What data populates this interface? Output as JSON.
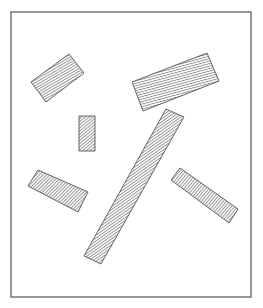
{
  "figure": {
    "width": 263,
    "height": 308,
    "background": "#ffffff",
    "frame": {
      "x": 11,
      "y": 12,
      "width": 240,
      "height": 285,
      "stroke": "#6b6b6b",
      "stroke_width": 1.4
    },
    "hatch": {
      "stroke": "#707070",
      "fill": "#ffffff",
      "outline": "#555555",
      "spacing": 2.4,
      "line_width": 0.8
    },
    "shapes": [
      {
        "name": "upper-left-bar",
        "points": [
          [
            31,
            82
          ],
          [
            69,
            54
          ],
          [
            84,
            73
          ],
          [
            46,
            102
          ]
        ],
        "hatch_angle": 60
      },
      {
        "name": "upper-right-bar",
        "points": [
          [
            132,
            82
          ],
          [
            207,
            53
          ],
          [
            219,
            81
          ],
          [
            143,
            111
          ]
        ],
        "hatch_angle": 75
      },
      {
        "name": "small-vertical-bar",
        "points": [
          [
            79,
            116
          ],
          [
            95,
            116
          ],
          [
            95,
            151
          ],
          [
            79,
            151
          ]
        ],
        "hatch_angle": 50
      },
      {
        "name": "long-diagonal-bar",
        "points": [
          [
            166,
            109
          ],
          [
            184,
            117
          ],
          [
            101,
            264
          ],
          [
            84,
            256
          ]
        ],
        "hatch_angle": 55
      },
      {
        "name": "lower-left-bar",
        "points": [
          [
            28,
            186
          ],
          [
            38,
            170
          ],
          [
            88,
            192
          ],
          [
            78,
            212
          ]
        ],
        "hatch_angle": 45
      },
      {
        "name": "lower-right-bar",
        "points": [
          [
            171,
            180
          ],
          [
            180,
            168
          ],
          [
            238,
            209
          ],
          [
            229,
            223
          ]
        ],
        "hatch_angle": 40
      }
    ]
  }
}
